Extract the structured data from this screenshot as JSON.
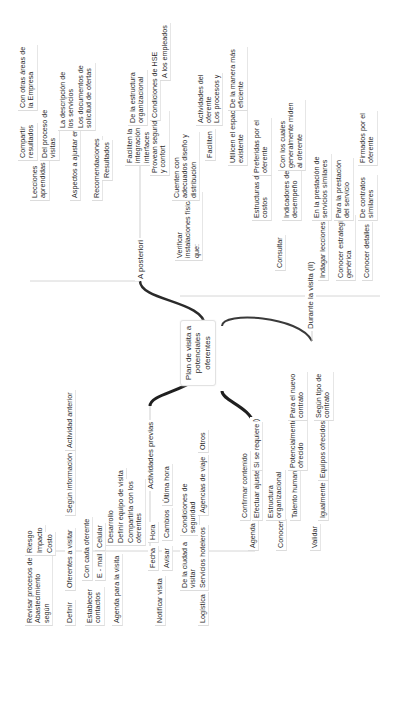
{
  "root": {
    "label": "Plan de visita a\npotenciales\noferentes"
  },
  "branches": [
    {
      "label": "Actividades previas",
      "children": [
        {
          "label": "Revisar procesos de\nAbastecimiento\nsegún",
          "children": [
            {
              "label": "Riesgo"
            },
            {
              "label": "Impacto"
            },
            {
              "label": "Costo"
            }
          ]
        },
        {
          "label": "Definir",
          "children": [
            {
              "label": "Oferentes a visitar",
              "children": [
                {
                  "label": "Según información",
                  "children": [
                    {
                      "label": "Actividad anterior"
                    }
                  ]
                }
              ]
            }
          ]
        },
        {
          "label": "Establecer\ncontactos",
          "children": [
            {
              "label": "Con cada oferente"
            },
            {
              "label": "E - mail",
              "children": [
                {
                  "label": "Celular"
                }
              ]
            }
          ]
        },
        {
          "label": "Agenda para la visita",
          "children": [
            {
              "label": "Desarrollo"
            },
            {
              "label": "Definir equipo de visita"
            },
            {
              "label": "Compartirla con los\noferentes"
            }
          ]
        },
        {
          "label": "Notificar visita",
          "children": [
            {
              "label": "Fecha",
              "children": [
                {
                  "label": "Hora"
                }
              ]
            },
            {
              "label": "Avisar",
              "children": [
                {
                  "label": "Cambios",
                  "children": [
                    {
                      "label": "Última hora"
                    }
                  ]
                }
              ]
            }
          ]
        },
        {
          "label": "Logística",
          "children": [
            {
              "label": "De la ciudad a\nvisitar",
              "children": [
                {
                  "label": "Condiciones de\nseguridad"
                }
              ]
            },
            {
              "label": "Servicios hoteleros",
              "children": [
                {
                  "label": "Agencias de viaje",
                  "children": [
                    {
                      "label": "Otros"
                    }
                  ]
                }
              ]
            }
          ]
        }
      ]
    },
    {
      "label": "Durante la visita (I)",
      "children": [
        {
          "label": "Agenda",
          "children": [
            {
              "label": "Confirmar contenido"
            },
            {
              "label": "Efectuar ajustes",
              "children": [
                {
                  "label": "Si se requiere"
                }
              ]
            }
          ]
        },
        {
          "label": "Conocer",
          "children": [
            {
              "label": "Estructura\norganizacional"
            },
            {
              "label": "Talento humano",
              "children": [
                {
                  "label": "Potencialmente\nofrecido",
                  "children": [
                    {
                      "label": "Para el nuevo\ncontrato"
                    }
                  ]
                }
              ]
            }
          ]
        },
        {
          "label": "Validar",
          "children": [
            {
              "label": "Igualmente",
              "children": [
                {
                  "label": "Equipos ofrecidos",
                  "children": [
                    {
                      "label": "Según tipo de\ncontrato"
                    }
                  ]
                }
              ]
            }
          ]
        }
      ]
    },
    {
      "label": "A posteriori",
      "children": [
        {
          "label": "Lecciones\naprendidas",
          "children": [
            {
              "label": "Compartir\nresultados",
              "children": [
                {
                  "label": "Con otras áreas de\nla Empresa"
                }
              ]
            },
            {
              "label": "Del proceso de\nvisitas"
            }
          ]
        },
        {
          "label": "Aspectos a ajustar en",
          "children": [
            {
              "label": "La descripción de\nlos servicios"
            },
            {
              "label": "Los documentos de\nsolicitud de ofertas"
            }
          ]
        },
        {
          "label": "Recomendaciones"
        },
        {
          "label": "Resultados"
        }
      ]
    },
    {
      "label": "Durante la visita (II)",
      "children": [
        {
          "label": "Verificar\ninstalaciones físicas\nque:",
          "children": [
            {
              "label": "Faciliten la\nintegración e\ninterfaces",
              "children": [
                {
                  "label": "De la estructura\norganizacional"
                }
              ]
            },
            {
              "label": "Provean seguridad\ny confort",
              "children": [
                {
                  "label": "Condiciones de HSE"
                },
                {
                  "label": "A los empleados"
                }
              ]
            },
            {
              "label": "Cuenten con\nadecuados diseño y\ndistribución"
            },
            {
              "label": "Faciliten",
              "children": [
                {
                  "label": "Actividades del\noferente"
                },
                {
                  "label": "Los procesos y"
                }
              ]
            },
            {
              "label": "Utilicen el espacio\nexistente",
              "children": [
                {
                  "label": "De la manera más\neficiente"
                }
              ]
            }
          ]
        },
        {
          "label": "Consultar",
          "children": [
            {
              "label": "Estructuras de\ncostos",
              "children": [
                {
                  "label": "Preferidas por el\noferente"
                }
              ]
            },
            {
              "label": "Indicadores de\ndesempeño",
              "children": [
                {
                  "label": "Con los cuales\ngeneralmente miden\nal oferente"
                }
              ]
            }
          ]
        },
        {
          "label": "Indagar lecciones",
          "children": [
            {
              "label": "En la prestación de\nservicios similares"
            }
          ]
        },
        {
          "label": "Conocer estrategia\ngenérica",
          "children": [
            {
              "label": "Para la prestación\ndel servicio"
            }
          ]
        },
        {
          "label": "Conocer detalles",
          "children": [
            {
              "label": "De contratos\nsimilares",
              "children": [
                {
                  "label": "Firmados por el\noferente"
                }
              ]
            }
          ]
        }
      ]
    }
  ],
  "colors": {
    "connector_main": "#1f1f1f",
    "connector_thin": "#cfcfcf",
    "text": "#2a2a2a",
    "background": "#ffffff"
  }
}
